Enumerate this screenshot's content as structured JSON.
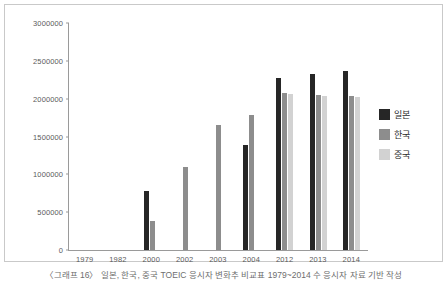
{
  "chart_data": {
    "type": "bar",
    "title": "",
    "xlabel": "",
    "ylabel": "",
    "ylim": [
      0,
      3000000
    ],
    "ytick_step": 500000,
    "grid": false,
    "legend_position": "right",
    "categories": [
      "1979",
      "1982",
      "2000",
      "2002",
      "2003",
      "2004",
      "2012",
      "2013",
      "2014"
    ],
    "yticks": [
      "0",
      "500000",
      "1000000",
      "1500000",
      "2000000",
      "2500000",
      "3000000"
    ],
    "series": [
      {
        "name": "일본",
        "color": "#262626",
        "values": [
          null,
          null,
          780000,
          null,
          null,
          1390000,
          2270000,
          2320000,
          2360000
        ]
      },
      {
        "name": "한국",
        "color": "#8d8d8d",
        "values": [
          null,
          null,
          390000,
          1100000,
          1650000,
          1790000,
          2070000,
          2050000,
          2030000
        ]
      },
      {
        "name": "중국",
        "color": "#d2d2d2",
        "values": [
          null,
          null,
          null,
          null,
          null,
          null,
          2060000,
          2040000,
          2020000
        ]
      }
    ]
  },
  "caption": {
    "text": "〈그래프 16〉 일본, 한국, 중국 TOEIC 응시자 변화추 비교표 1979~2014 수 응시자 자료 기반 작성"
  }
}
